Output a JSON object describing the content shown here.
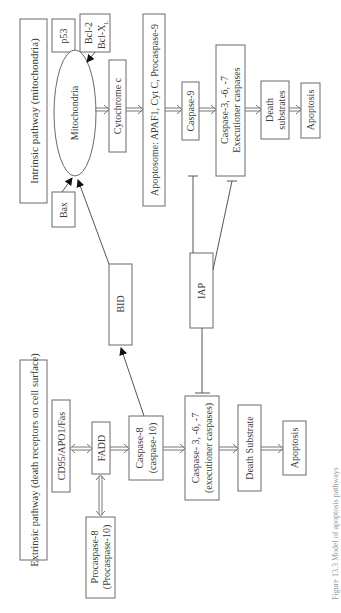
{
  "diagram": {
    "intrinsic": {
      "title": "Intrinsic pathway (mitochondria)",
      "p53": "p53",
      "bcl2": "Bcl-2",
      "bclxl": "Bcl-X",
      "bclxl_sub": "L",
      "mitochondria": "Mitochondria",
      "bax": "Bax",
      "cytochrome": "Cytochrome c",
      "apoptosome": "Apoptosome: APAF1, Cyt C, Procaspase-9",
      "caspase9": "Caspase-9",
      "caspase367_line1": "Caspase-3, -6, -7",
      "caspase367_line2": "Executioner caspases",
      "death_line1": "Death",
      "death_line2": "substrates",
      "apoptosis": "Apoptosis"
    },
    "cross": {
      "bid": "BID",
      "iap": "IAP"
    },
    "extrinsic": {
      "title": "Extrinsic pathway (death receptors on cell surface)",
      "cd95": "CD95/APO1/Fas",
      "fadd": "FADD",
      "procaspase_line1": "Procaspase-8",
      "procaspase_line2": "(Procaspase-10)",
      "caspase8_line1": "Caspase-8",
      "caspase8_line2": "(caspase-10)",
      "caspase367_line1": "Caspase- 3, -6, -7",
      "caspase367_line2": "(executioner caspases)",
      "death": "Death Substrate",
      "apoptosis": "Apoptosis"
    },
    "caption": "Figure 13.3  Model of apoptosis pathways",
    "colors": {
      "stroke": "#6a6a6a",
      "text": "#3a3a3a",
      "background": "#ffffff"
    }
  }
}
